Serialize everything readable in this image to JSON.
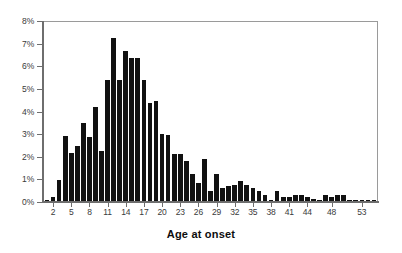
{
  "chart_data": {
    "type": "bar",
    "title": "",
    "subtitle": "",
    "xlabel": "Age at onset",
    "ylabel": "",
    "xlim": [
      0.5,
      55.5
    ],
    "ylim": [
      0,
      8
    ],
    "grid": false,
    "legend": null,
    "bar_color": "#111111",
    "frame_color": "#8c8c8c",
    "axis_color": "#6e6e6e",
    "ytick_labels": [
      "0%",
      "1%",
      "2%",
      "3%",
      "4%",
      "5%",
      "6%",
      "7%",
      "8%"
    ],
    "ytick_values": [
      0,
      1,
      2,
      3,
      4,
      5,
      6,
      7,
      8
    ],
    "xtick_labels": [
      "2",
      "5",
      "8",
      "11",
      "14",
      "17",
      "20",
      "23",
      "26",
      "29",
      "32",
      "35",
      "38",
      "41",
      "44",
      "48",
      "53"
    ],
    "xtick_values": [
      2,
      5,
      8,
      11,
      14,
      17,
      20,
      23,
      26,
      29,
      32,
      35,
      38,
      41,
      44,
      48,
      53
    ],
    "categories": [
      1,
      2,
      3,
      4,
      5,
      6,
      7,
      8,
      9,
      10,
      11,
      12,
      13,
      14,
      15,
      16,
      17,
      18,
      19,
      20,
      21,
      22,
      23,
      24,
      25,
      26,
      27,
      28,
      29,
      30,
      31,
      32,
      33,
      34,
      35,
      36,
      37,
      38,
      39,
      40,
      41,
      42,
      43,
      44,
      45,
      46,
      47,
      48,
      49,
      50,
      51,
      52,
      53,
      54,
      55
    ],
    "values": [
      0.05,
      0.2,
      0.95,
      2.9,
      2.15,
      2.45,
      3.5,
      2.85,
      4.2,
      2.25,
      5.4,
      7.3,
      5.4,
      6.7,
      6.4,
      6.4,
      5.4,
      4.4,
      4.45,
      3.0,
      2.95,
      2.1,
      2.1,
      1.8,
      1.2,
      0.8,
      1.9,
      0.45,
      1.2,
      0.6,
      0.65,
      0.7,
      0.9,
      0.7,
      0.6,
      0.45,
      0.25,
      0.05,
      0.45,
      0.2,
      0.2,
      0.25,
      0.25,
      0.2,
      0.1,
      0.05,
      0.25,
      0.2,
      0.25,
      0.25,
      0.05,
      0.05,
      0.05,
      0.05,
      0.05
    ]
  },
  "figure": {
    "xaxis_title": "Age at onset"
  }
}
